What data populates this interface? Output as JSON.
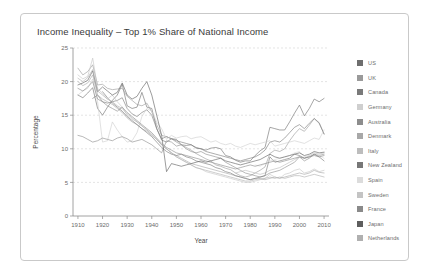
{
  "card": {
    "title": "Income Inequality – Top 1% Share of National Income"
  },
  "chart_data": {
    "type": "line",
    "title": "Income Inequality – Top 1% Share of National Income",
    "xlabel": "Year",
    "ylabel": "Percentage",
    "xlim": [
      1908,
      2012
    ],
    "ylim": [
      0,
      25
    ],
    "xticks": [
      1910,
      1920,
      1930,
      1940,
      1950,
      1960,
      1970,
      1980,
      1990,
      2000,
      2010
    ],
    "yticks": [
      0,
      5,
      10,
      15,
      20,
      25
    ],
    "grid": true,
    "legend_position": "right",
    "x": [
      1910,
      1912,
      1914,
      1916,
      1918,
      1920,
      1922,
      1924,
      1926,
      1928,
      1930,
      1932,
      1934,
      1936,
      1938,
      1940,
      1942,
      1944,
      1946,
      1948,
      1950,
      1952,
      1954,
      1956,
      1958,
      1960,
      1962,
      1964,
      1966,
      1968,
      1970,
      1972,
      1974,
      1976,
      1978,
      1980,
      1982,
      1984,
      1986,
      1988,
      1990,
      1992,
      1994,
      1996,
      1998,
      2000,
      2002,
      2004,
      2006,
      2008,
      2010
    ],
    "series": [
      {
        "name": "US",
        "color": "#6e6e6e",
        "values": [
          18.0,
          17.6,
          18.3,
          19.1,
          16.0,
          15.0,
          16.2,
          17.2,
          18.0,
          19.6,
          16.4,
          16.0,
          16.2,
          18.4,
          16.2,
          16.0,
          13.0,
          11.3,
          11.0,
          11.5,
          11.4,
          10.6,
          10.5,
          10.6,
          10.1,
          10.0,
          9.8,
          10.1,
          10.2,
          10.0,
          9.0,
          8.8,
          8.3,
          8.0,
          8.2,
          8.2,
          9.0,
          9.7,
          10.2,
          13.2,
          13.0,
          12.8,
          12.8,
          14.0,
          15.3,
          16.5,
          14.9,
          16.0,
          17.4,
          17.0,
          17.5
        ]
      },
      {
        "name": "UK",
        "color": "#9a9a9a",
        "values": [
          22.0,
          21.0,
          21.5,
          22.5,
          19.5,
          19.6,
          19.0,
          18.8,
          18.9,
          19.0,
          17.8,
          17.2,
          16.6,
          16.4,
          16.8,
          15.5,
          13.6,
          12.0,
          11.8,
          11.5,
          11.0,
          10.6,
          10.2,
          9.8,
          9.3,
          8.9,
          8.5,
          8.2,
          7.6,
          7.4,
          7.1,
          6.9,
          6.4,
          6.0,
          5.8,
          6.0,
          6.4,
          6.8,
          7.3,
          9.3,
          9.8,
          9.6,
          10.0,
          11.2,
          12.2,
          13.0,
          12.6,
          13.5,
          14.5,
          13.9,
          12.2
        ]
      },
      {
        "name": "Canada",
        "color": "#7a7a7a",
        "values": [
          null,
          null,
          null,
          17.5,
          18.0,
          17.0,
          16.8,
          17.0,
          17.2,
          17.6,
          16.0,
          15.2,
          14.8,
          15.4,
          15.8,
          15.0,
          13.0,
          11.5,
          11.8,
          11.5,
          11.2,
          11.0,
          10.8,
          10.6,
          10.2,
          10.0,
          9.6,
          9.4,
          9.2,
          9.0,
          8.8,
          8.6,
          8.4,
          8.2,
          8.4,
          8.6,
          8.8,
          9.2,
          9.8,
          11.0,
          11.2,
          11.0,
          11.6,
          12.4,
          13.2,
          13.6,
          13.0,
          13.8,
          14.5,
          13.8,
          12.2
        ]
      },
      {
        "name": "Germany",
        "color": "#cfcfcf",
        "values": [
          18.0,
          18.6,
          19.0,
          20.4,
          17.0,
          11.0,
          11.2,
          14.0,
          12.8,
          11.8,
          11.0,
          11.2,
          12.4,
          14.8,
          16.0,
          15.6,
          14.0,
          13.0,
          11.4,
          12.0,
          11.6,
          11.8,
          11.9,
          11.5,
          11.7,
          11.8,
          11.4,
          11.0,
          11.2,
          10.8,
          10.6,
          10.8,
          10.4,
          10.2,
          10.5,
          10.8,
          10.6,
          10.8,
          11.0,
          11.2,
          10.4,
          10.6,
          10.8,
          11.0,
          11.2,
          11.0,
          10.8,
          11.2,
          11.6,
          11.4,
          12.8
        ]
      },
      {
        "name": "Australia",
        "color": "#8d8d8d",
        "values": [
          12.0,
          11.8,
          11.4,
          11.0,
          11.2,
          11.6,
          11.4,
          11.2,
          11.6,
          11.8,
          11.5,
          11.0,
          11.2,
          11.4,
          11.0,
          10.6,
          10.0,
          9.4,
          11.2,
          11.0,
          10.4,
          10.6,
          10.0,
          9.6,
          9.4,
          9.6,
          9.2,
          9.0,
          8.8,
          8.6,
          8.0,
          7.6,
          7.2,
          6.8,
          6.4,
          6.2,
          6.0,
          5.8,
          6.0,
          6.4,
          6.6,
          6.8,
          7.2,
          7.6,
          8.0,
          8.8,
          8.2,
          8.6,
          9.2,
          9.0,
          9.2
        ]
      },
      {
        "name": "Denmark",
        "color": "#a8a8a8",
        "values": [
          20.0,
          19.4,
          19.8,
          21.0,
          18.0,
          17.4,
          17.0,
          16.6,
          16.0,
          15.4,
          14.6,
          14.0,
          13.6,
          13.0,
          12.6,
          12.0,
          11.4,
          10.6,
          10.0,
          9.4,
          9.0,
          8.6,
          8.2,
          7.8,
          7.6,
          7.4,
          7.2,
          7.0,
          6.8,
          6.6,
          6.4,
          6.2,
          6.0,
          5.8,
          5.6,
          5.4,
          5.6,
          5.5,
          5.4,
          5.6,
          5.8,
          5.6,
          5.8,
          6.0,
          6.2,
          6.4,
          6.2,
          6.4,
          6.8,
          6.5,
          6.4
        ]
      },
      {
        "name": "Italy",
        "color": "#bdbdbd",
        "values": [
          null,
          null,
          null,
          null,
          null,
          null,
          null,
          null,
          null,
          null,
          null,
          null,
          null,
          null,
          null,
          null,
          null,
          null,
          null,
          null,
          null,
          null,
          null,
          null,
          null,
          null,
          null,
          null,
          null,
          null,
          null,
          null,
          6.4,
          6.6,
          6.8,
          6.6,
          6.4,
          6.2,
          6.4,
          6.8,
          7.0,
          7.2,
          7.6,
          8.0,
          8.4,
          8.8,
          8.6,
          9.0,
          9.4,
          9.2,
          9.4
        ]
      },
      {
        "name": "New Zealand",
        "color": "#777777",
        "values": [
          null,
          null,
          null,
          null,
          null,
          18.5,
          17.6,
          16.8,
          16.2,
          15.6,
          14.8,
          14.2,
          13.6,
          13.0,
          12.4,
          11.8,
          11.0,
          10.2,
          9.6,
          9.2,
          9.0,
          9.2,
          8.8,
          8.6,
          8.2,
          8.0,
          7.8,
          7.6,
          7.2,
          7.0,
          6.6,
          6.4,
          6.0,
          5.8,
          5.6,
          5.4,
          5.6,
          5.8,
          6.0,
          8.8,
          8.0,
          8.2,
          8.4,
          8.6,
          9.2,
          9.0,
          8.6,
          8.8,
          9.2,
          8.8,
          8.2
        ]
      },
      {
        "name": "Spain",
        "color": "#dcdcdc",
        "values": [
          null,
          null,
          null,
          null,
          null,
          null,
          null,
          null,
          null,
          null,
          null,
          null,
          null,
          null,
          null,
          null,
          null,
          null,
          null,
          null,
          null,
          null,
          null,
          null,
          null,
          null,
          null,
          null,
          null,
          null,
          null,
          null,
          null,
          null,
          null,
          null,
          7.6,
          7.4,
          7.8,
          8.2,
          8.4,
          8.6,
          8.8,
          9.0,
          9.4,
          9.6,
          8.8,
          9.0,
          9.4,
          9.0,
          8.6
        ]
      },
      {
        "name": "Sweden",
        "color": "#c4c4c4",
        "values": [
          21.0,
          20.4,
          20.8,
          23.5,
          19.0,
          18.2,
          17.4,
          18.0,
          17.0,
          16.2,
          15.0,
          14.4,
          14.0,
          13.4,
          12.8,
          12.0,
          11.4,
          10.6,
          10.0,
          9.4,
          8.8,
          8.4,
          8.0,
          7.6,
          7.2,
          7.0,
          6.6,
          6.4,
          6.2,
          6.0,
          5.8,
          5.6,
          5.4,
          5.2,
          5.0,
          5.0,
          5.2,
          5.4,
          5.6,
          6.2,
          5.8,
          5.6,
          6.2,
          6.4,
          6.8,
          7.0,
          6.4,
          6.6,
          7.0,
          6.6,
          6.8
        ]
      },
      {
        "name": "France",
        "color": "#8a8a8a",
        "values": [
          19.0,
          18.6,
          19.2,
          20.0,
          17.4,
          17.0,
          16.4,
          16.0,
          15.6,
          16.2,
          15.4,
          14.8,
          14.2,
          13.6,
          13.0,
          12.4,
          11.6,
          10.8,
          10.2,
          9.8,
          9.4,
          9.2,
          9.0,
          8.8,
          8.6,
          8.4,
          8.2,
          8.0,
          7.8,
          7.6,
          7.4,
          7.2,
          7.0,
          7.2,
          7.4,
          7.6,
          7.4,
          7.6,
          7.8,
          8.0,
          8.2,
          8.0,
          8.2,
          8.4,
          8.6,
          8.8,
          8.6,
          8.8,
          9.0,
          8.8,
          9.0
        ]
      },
      {
        "name": "Japan",
        "color": "#5e5e5e",
        "values": [
          19.5,
          19.8,
          20.2,
          21.6,
          18.5,
          19.2,
          18.6,
          18.0,
          18.4,
          19.8,
          18.0,
          17.4,
          17.8,
          19.0,
          20.0,
          18.0,
          15.0,
          12.0,
          6.6,
          7.8,
          7.6,
          7.4,
          7.6,
          7.8,
          8.0,
          8.2,
          8.0,
          8.2,
          8.4,
          8.6,
          8.2,
          8.0,
          7.8,
          7.6,
          7.8,
          8.0,
          8.2,
          8.4,
          8.8,
          9.2,
          8.8,
          8.6,
          8.8,
          9.0,
          9.2,
          9.4,
          9.0,
          9.2,
          9.6,
          9.4,
          9.5
        ]
      },
      {
        "name": "Netherlands",
        "color": "#b0b0b0",
        "values": [
          20.5,
          20.0,
          20.6,
          21.8,
          18.6,
          18.0,
          17.4,
          17.0,
          16.4,
          16.0,
          15.2,
          14.6,
          14.0,
          13.4,
          12.8,
          12.2,
          11.4,
          10.6,
          10.0,
          9.4,
          8.8,
          8.4,
          8.0,
          7.6,
          7.2,
          7.0,
          6.8,
          6.6,
          6.4,
          6.2,
          6.0,
          5.8,
          5.6,
          5.4,
          5.2,
          5.2,
          5.4,
          5.6,
          5.6,
          5.8,
          5.6,
          5.8,
          5.6,
          5.8,
          6.0,
          6.0,
          5.8,
          6.0,
          6.2,
          6.0,
          5.8
        ]
      }
    ]
  }
}
